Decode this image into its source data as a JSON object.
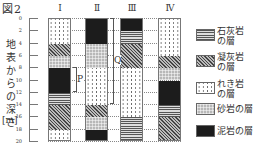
{
  "figure": {
    "title": "図2",
    "y_axis": {
      "label": "地表からの深さ",
      "unit": "[m]",
      "ticks": [
        "0",
        "2",
        "4",
        "6",
        "8",
        "10",
        "12",
        "14",
        "16",
        "18",
        "20"
      ],
      "range": [
        0,
        20
      ]
    },
    "columns": [
      {
        "label": "Ⅰ",
        "layers": [
          {
            "from": 0,
            "to": 4,
            "rock": "gravel"
          },
          {
            "from": 4,
            "to": 6,
            "rock": "tuff"
          },
          {
            "from": 6,
            "to": 8,
            "rock": "sandstone"
          },
          {
            "from": 8,
            "to": 12,
            "rock": "mudstone"
          },
          {
            "from": 12,
            "to": 14,
            "rock": "limestone"
          },
          {
            "from": 14,
            "to": 18,
            "rock": "tuff"
          },
          {
            "from": 18,
            "to": 20,
            "rock": "gravel"
          }
        ]
      },
      {
        "label": "Ⅱ",
        "layers": [
          {
            "from": 0,
            "to": 4,
            "rock": "mudstone"
          },
          {
            "from": 4,
            "to": 8,
            "rock": "sandstone"
          },
          {
            "from": 8,
            "to": 14,
            "rock": "gravel"
          },
          {
            "from": 14,
            "to": 16,
            "rock": "tuff"
          },
          {
            "from": 16,
            "to": 18,
            "rock": "sandstone"
          },
          {
            "from": 18,
            "to": 20,
            "rock": "mudstone"
          }
        ]
      },
      {
        "label": "Ⅲ",
        "layers": [
          {
            "from": 0,
            "to": 2,
            "rock": "mudstone"
          },
          {
            "from": 2,
            "to": 4,
            "rock": "limestone"
          },
          {
            "from": 4,
            "to": 8,
            "rock": "tuff"
          },
          {
            "from": 8,
            "to": 16,
            "rock": "gravel"
          },
          {
            "from": 16,
            "to": 20,
            "rock": "limestone"
          }
        ]
      },
      {
        "label": "Ⅳ",
        "layers": [
          {
            "from": 0,
            "to": 6,
            "rock": "gravel"
          },
          {
            "from": 6,
            "to": 8,
            "rock": "tuff"
          },
          {
            "from": 8,
            "to": 10,
            "rock": "sandstone"
          },
          {
            "from": 10,
            "to": 14,
            "rock": "mudstone"
          },
          {
            "from": 14,
            "to": 16,
            "rock": "limestone"
          },
          {
            "from": 16,
            "to": 20,
            "rock": "tuff"
          }
        ]
      }
    ],
    "brackets": [
      {
        "label": "P",
        "from": 8,
        "to": 12,
        "after_column": 0
      },
      {
        "label": "Q",
        "from": 0,
        "to": 14,
        "after_column": 1
      }
    ],
    "legend": [
      {
        "rock": "limestone",
        "line1": "石灰岩",
        "line2": "の層"
      },
      {
        "rock": "tuff",
        "line1": "凝灰岩",
        "line2": "の層"
      },
      {
        "rock": "gravel",
        "line1": "れき岩",
        "line2": "の層"
      },
      {
        "rock": "sandstone",
        "line1": "砂岩の層",
        "line2": ""
      },
      {
        "rock": "mudstone",
        "line1": "泥岩の層",
        "line2": ""
      }
    ]
  }
}
